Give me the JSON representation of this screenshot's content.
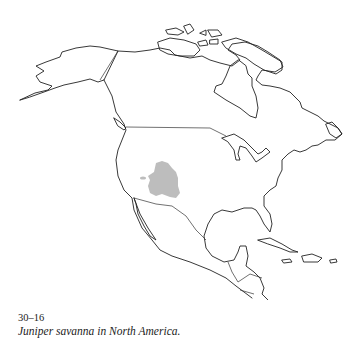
{
  "figure": {
    "number": "30–16",
    "caption": "Juniper savanna in North America."
  },
  "map": {
    "region": "North America",
    "highlighted_range": "Juniper savanna",
    "range_color": "#bdbdbd",
    "outline_color": "#222222"
  }
}
